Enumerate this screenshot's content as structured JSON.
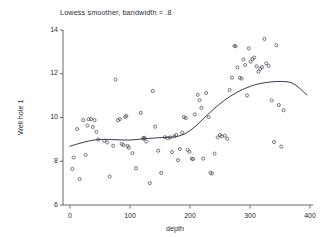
{
  "chart_data": {
    "type": "scatter",
    "title": "Lowess smoother, bandwidth = .8",
    "xlabel": "depth",
    "ylabel": "Well hole 1",
    "xlim": [
      0,
      400
    ],
    "ylim": [
      6,
      14
    ],
    "xticks": [
      0,
      100,
      200,
      300,
      400
    ],
    "yticks": [
      6,
      8,
      10,
      12,
      14
    ],
    "xtick_labels": [
      "0",
      "100",
      "200",
      "300",
      "400"
    ],
    "ytick_labels": [
      "6",
      "8",
      "10",
      "12",
      "14"
    ],
    "grid": false,
    "legend": false,
    "marker": "open-circle",
    "marker_color": "#4a4a57",
    "line_color": "#3d3d52",
    "series": [
      {
        "name": "observations",
        "type": "scatter",
        "points": [
          [
            4,
            7.65
          ],
          [
            6,
            8.17
          ],
          [
            12,
            9.47
          ],
          [
            16,
            7.19
          ],
          [
            22,
            9.88
          ],
          [
            26,
            8.29
          ],
          [
            29,
            9.63
          ],
          [
            31,
            9.92
          ],
          [
            35,
            9.93
          ],
          [
            38,
            9.57
          ],
          [
            41,
            9.88
          ],
          [
            44,
            9.35
          ],
          [
            47,
            8.99
          ],
          [
            57,
            8.93
          ],
          [
            62,
            8.86
          ],
          [
            66,
            7.3
          ],
          [
            72,
            8.71
          ],
          [
            76,
            11.73
          ],
          [
            80,
            9.87
          ],
          [
            83,
            9.93
          ],
          [
            86,
            8.79
          ],
          [
            89,
            8.74
          ],
          [
            92,
            10.03
          ],
          [
            94,
            10.07
          ],
          [
            96,
            8.7
          ],
          [
            98,
            8.62
          ],
          [
            104,
            8.37
          ],
          [
            110,
            7.68
          ],
          [
            118,
            10.21
          ],
          [
            122,
            9.05
          ],
          [
            123,
            9.04
          ],
          [
            124,
            9.07
          ],
          [
            127,
            8.9
          ],
          [
            133,
            7.0
          ],
          [
            138,
            11.21
          ],
          [
            142,
            9.58
          ],
          [
            147,
            8.48
          ],
          [
            152,
            7.47
          ],
          [
            158,
            9.1
          ],
          [
            163,
            9.06
          ],
          [
            167,
            9.09
          ],
          [
            170,
            8.42
          ],
          [
            174,
            9.14
          ],
          [
            177,
            9.2
          ],
          [
            180,
            8.05
          ],
          [
            183,
            8.56
          ],
          [
            187,
            9.31
          ],
          [
            190,
            10.02
          ],
          [
            193,
            9.97
          ],
          [
            196,
            8.52
          ],
          [
            199,
            8.43
          ],
          [
            203,
            8.12
          ],
          [
            205,
            8.1
          ],
          [
            208,
            10.14
          ],
          [
            213,
            11.04
          ],
          [
            216,
            10.79
          ],
          [
            219,
            10.44
          ],
          [
            222,
            8.12
          ],
          [
            227,
            11.12
          ],
          [
            231,
            10.02
          ],
          [
            234,
            7.48
          ],
          [
            237,
            7.44
          ],
          [
            241,
            8.35
          ],
          [
            246,
            9.09
          ],
          [
            250,
            9.2
          ],
          [
            253,
            9.14
          ],
          [
            258,
            9.17
          ],
          [
            262,
            9.03
          ],
          [
            266,
            11.26
          ],
          [
            270,
            11.82
          ],
          [
            274,
            13.27
          ],
          [
            276,
            13.26
          ],
          [
            279,
            12.29
          ],
          [
            283,
            11.82
          ],
          [
            286,
            11.78
          ],
          [
            289,
            12.65
          ],
          [
            292,
            12.4
          ],
          [
            295,
            11.01
          ],
          [
            298,
            13.16
          ],
          [
            301,
            12.55
          ],
          [
            304,
            12.67
          ],
          [
            307,
            12.74
          ],
          [
            311,
            12.34
          ],
          [
            314,
            12.09
          ],
          [
            317,
            12.22
          ],
          [
            320,
            12.3
          ],
          [
            324,
            13.59
          ],
          [
            327,
            12.48
          ],
          [
            331,
            12.36
          ],
          [
            336,
            10.78
          ],
          [
            340,
            8.88
          ],
          [
            344,
            13.3
          ],
          [
            348,
            10.57
          ],
          [
            352,
            8.67
          ],
          [
            356,
            10.33
          ]
        ]
      },
      {
        "name": "lowess smoother",
        "type": "line",
        "points": [
          [
            0,
            8.69
          ],
          [
            10,
            8.77
          ],
          [
            20,
            8.85
          ],
          [
            30,
            8.92
          ],
          [
            40,
            8.97
          ],
          [
            50,
            9.0
          ],
          [
            60,
            9.0
          ],
          [
            70,
            8.99
          ],
          [
            80,
            8.98
          ],
          [
            90,
            8.97
          ],
          [
            100,
            8.97
          ],
          [
            110,
            8.99
          ],
          [
            120,
            9.02
          ],
          [
            130,
            9.04
          ],
          [
            140,
            9.06
          ],
          [
            150,
            9.08
          ],
          [
            160,
            9.09
          ],
          [
            170,
            9.1
          ],
          [
            180,
            9.14
          ],
          [
            190,
            9.23
          ],
          [
            200,
            9.4
          ],
          [
            210,
            9.62
          ],
          [
            220,
            9.88
          ],
          [
            230,
            10.15
          ],
          [
            240,
            10.4
          ],
          [
            250,
            10.63
          ],
          [
            260,
            10.84
          ],
          [
            270,
            11.02
          ],
          [
            280,
            11.18
          ],
          [
            290,
            11.31
          ],
          [
            300,
            11.42
          ],
          [
            310,
            11.51
          ],
          [
            320,
            11.57
          ],
          [
            330,
            11.61
          ],
          [
            340,
            11.64
          ],
          [
            350,
            11.65
          ],
          [
            360,
            11.64
          ],
          [
            365,
            11.62
          ],
          [
            370,
            11.58
          ],
          [
            375,
            11.5
          ],
          [
            380,
            11.4
          ],
          [
            385,
            11.28
          ],
          [
            390,
            11.15
          ],
          [
            395,
            11.02
          ]
        ]
      }
    ]
  }
}
